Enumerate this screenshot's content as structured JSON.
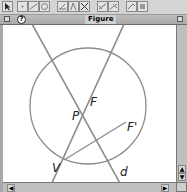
{
  "toolbar": {
    "buttons": [
      {
        "name": "pointer-tool",
        "icon": "arrow-pointer-icon"
      },
      {
        "name": "point-tool",
        "icon": "point-icon"
      },
      {
        "name": "line-tool",
        "icon": "line-icon"
      },
      {
        "name": "circle-tool",
        "icon": "circle-icon"
      },
      {
        "name": "construct-tool-1",
        "icon": "perpendicular-icon"
      },
      {
        "name": "construct-tool-2",
        "icon": "angle-icon"
      },
      {
        "name": "construct-tool-3",
        "icon": "intersection-icon"
      },
      {
        "name": "transform-tool-1",
        "icon": "reflect-icon"
      },
      {
        "name": "transform-tool-2",
        "icon": "rotate-icon"
      },
      {
        "name": "measure-tool-1",
        "icon": "measure-icon"
      },
      {
        "name": "measure-tool-2",
        "icon": "display-icon"
      }
    ]
  },
  "window": {
    "title": "Figure",
    "help_glyph": "?"
  },
  "figure": {
    "circle": {
      "cx": 85,
      "cy": 81,
      "r": 58
    },
    "lines": [
      {
        "name": "line-through-V-and-P",
        "x1": 121,
        "y1": -1,
        "x2": 48,
        "y2": 160
      },
      {
        "name": "directrix-d",
        "x1": 29,
        "y1": -1,
        "x2": 118,
        "y2": 160
      }
    ],
    "segment": {
      "name": "segment-V-Fprime",
      "x1": 61,
      "y1": 135,
      "x2": 123,
      "y2": 97
    },
    "points": [
      {
        "label": "P",
        "x": 80,
        "y": 83,
        "lx": 69,
        "ly": 85
      },
      {
        "label": "F",
        "x": 84,
        "y": 78,
        "lx": 87,
        "ly": 71
      },
      {
        "label": "F'",
        "x": 123,
        "y": 97,
        "lx": 124,
        "ly": 96
      },
      {
        "label": "V",
        "x": 61,
        "y": 135,
        "lx": 49,
        "ly": 137
      },
      {
        "label": "d",
        "x": 0,
        "y": 0,
        "lx": 117,
        "ly": 141
      }
    ],
    "stroke_color": "#8c8c8c"
  },
  "scrollbars": {
    "up": "▲",
    "down": "▼",
    "left": "◀",
    "right": "▶"
  }
}
